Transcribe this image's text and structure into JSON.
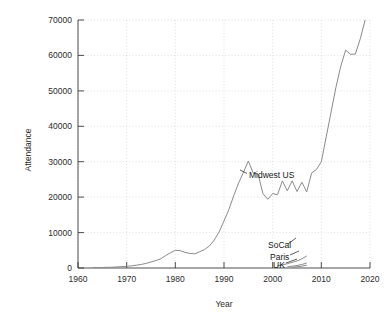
{
  "chart_data": {
    "type": "line",
    "title": "",
    "xlabel": "Year",
    "ylabel": "Attendance",
    "xlim": [
      1960,
      2020
    ],
    "ylim": [
      0,
      70000
    ],
    "xticks": [
      1960,
      1970,
      1980,
      1990,
      2000,
      2010,
      2020
    ],
    "yticks": [
      0,
      10000,
      20000,
      30000,
      40000,
      50000,
      60000,
      70000
    ],
    "grid": true,
    "legend_position": "inline-annotations",
    "line_color": "#8a8a8a",
    "annotations": [
      {
        "text": "Midwest US",
        "x": 1996.5,
        "y": 27500
      },
      {
        "text": "SoCal",
        "x": 2002.5,
        "y": 5200
      },
      {
        "text": "Paris",
        "x": 2003.0,
        "y": 3000
      },
      {
        "text": "UK",
        "x": 2003.4,
        "y": 1200
      }
    ],
    "series": [
      {
        "name": "Midwest US",
        "color": "#8a8a8a",
        "x": [
          1963,
          1964,
          1965,
          1966,
          1967,
          1968,
          1969,
          1970,
          1971,
          1972,
          1973,
          1974,
          1975,
          1976,
          1977,
          1978,
          1979,
          1980,
          1981,
          1982,
          1983,
          1984,
          1985,
          1986,
          1987,
          1988,
          1989,
          1990,
          1991,
          1992,
          1993,
          1994,
          1995,
          1996,
          1997,
          1998,
          1999,
          2000,
          2001,
          2002,
          2003,
          2004,
          2005,
          2006,
          2007,
          2008,
          2009,
          2010,
          2011,
          2012,
          2013,
          2014,
          2015,
          2016,
          2017,
          2018,
          2019
        ],
        "values": [
          100,
          120,
          150,
          180,
          220,
          300,
          400,
          480,
          600,
          800,
          1000,
          1300,
          1700,
          2100,
          2600,
          3500,
          4300,
          5000,
          4900,
          4400,
          4100,
          4000,
          4600,
          5200,
          6200,
          7900,
          10200,
          13300,
          16500,
          20400,
          24000,
          27000,
          30200,
          26800,
          26500,
          21000,
          19400,
          21000,
          20700,
          24600,
          21800,
          24600,
          21600,
          24200,
          21500,
          26800,
          27800,
          30000,
          37000,
          44000,
          51000,
          57000,
          61500,
          60300,
          60400,
          64700,
          70000
        ]
      },
      {
        "name": "SoCal",
        "color": "#8a8a8a",
        "x": [
          2001,
          2002,
          2003,
          2004,
          2005,
          2006,
          2007
        ],
        "values": [
          600,
          900,
          1200,
          1600,
          2000,
          2600,
          3400
        ]
      },
      {
        "name": "Paris",
        "color": "#8a8a8a",
        "x": [
          2003,
          2004,
          2005,
          2006,
          2007
        ],
        "values": [
          300,
          500,
          700,
          1000,
          1400
        ]
      },
      {
        "name": "UK",
        "color": "#8a8a8a",
        "x": [
          2004,
          2005,
          2006,
          2007
        ],
        "values": [
          200,
          350,
          500,
          800
        ]
      }
    ]
  },
  "axes": {
    "ylabel": "Attendance",
    "xlabel": "Year",
    "ytick_labels": [
      "70000",
      "60000",
      "50000",
      "40000",
      "30000",
      "20000",
      "10000",
      "0"
    ],
    "xtick_labels": [
      "1960",
      "1970",
      "1980",
      "1990",
      "2000",
      "2010",
      "2020"
    ]
  },
  "annotations": {
    "midwest": "Midwest US",
    "socal": "SoCal",
    "paris": "Paris",
    "uk": "UK"
  }
}
